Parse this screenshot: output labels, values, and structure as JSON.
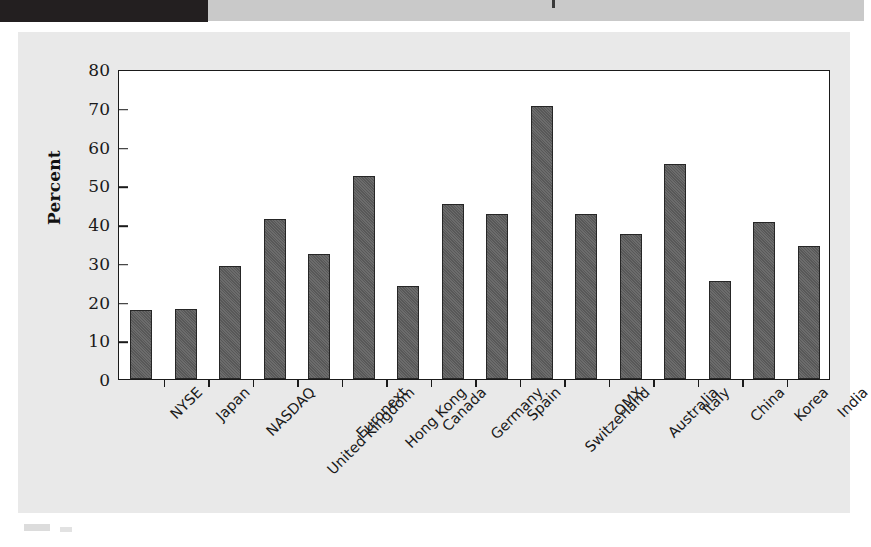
{
  "page": {
    "background_color": "#ffffff",
    "panel_color": "#e9e9e9",
    "strip_dark_color": "#231f20",
    "strip_light_color": "#c9c9c9",
    "bar_color": "#585858",
    "bar_border_color": "#262626",
    "axis_color": "#1a1a1a"
  },
  "chart_data": {
    "type": "bar",
    "title": "",
    "xlabel": "",
    "ylabel": "Percent",
    "ylim": [
      0,
      80
    ],
    "yticks": [
      0,
      10,
      20,
      30,
      40,
      50,
      60,
      70,
      80
    ],
    "ytick_labels": [
      "0",
      "10",
      "20",
      "30",
      "40",
      "50",
      "60",
      "70",
      "80"
    ],
    "grid": false,
    "legend": null,
    "categories": [
      "NYSE",
      "Japan",
      "NASDAQ",
      "United Kingdom",
      "Euronext",
      "Hong Kong",
      "Canada",
      "Germany",
      "Spain",
      "Switzerland",
      "OMX",
      "Australia",
      "Italy",
      "China",
      "Korea",
      "India"
    ],
    "values": [
      17.9,
      18.0,
      29.1,
      41.4,
      32.3,
      52.3,
      24.1,
      45.2,
      42.5,
      70.5,
      42.5,
      37.4,
      55.4,
      25.2,
      40.6,
      34.3
    ]
  }
}
